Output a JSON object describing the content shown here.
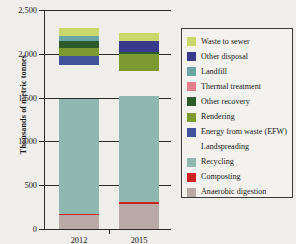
{
  "axes": {
    "y_title": "Thousands of metric tonnes",
    "y_ticks": [
      "2,500",
      "2,000",
      "1,500",
      "1,000",
      "500",
      "0"
    ],
    "x_labels": [
      "2012",
      "2015"
    ]
  },
  "legend": {
    "items": [
      {
        "label": "Waste to sewer",
        "color": "#cad86b"
      },
      {
        "label": "Other disposal",
        "color": "#3a3a8c"
      },
      {
        "label": "Landfill",
        "color": "#6aa6a6"
      },
      {
        "label": "Thermal treatment",
        "color": "#e4808e"
      },
      {
        "label": "Other recovery",
        "color": "#2c5c2c"
      },
      {
        "label": "Rendering",
        "color": "#7d9a30"
      },
      {
        "label": "Energy from waste (EFW)",
        "color": "#41529a"
      },
      {
        "label": "Landspreading",
        "color": "#a濃"
      },
      {
        "label": "Recycling",
        "color": "#8fb8b0"
      },
      {
        "label": "Composting",
        "color": "#cc2222"
      },
      {
        "label": "Anaerobic digestion",
        "color": "#b9aaa8"
      }
    ]
  },
  "chart_data": {
    "type": "bar",
    "title": "",
    "xlabel": "",
    "ylabel": "Thousands of metric tonnes",
    "ylim": [
      0,
      2500
    ],
    "ytick_values": [
      0,
      500,
      1000,
      1500,
      2000,
      2500
    ],
    "grid": false,
    "stacked": true,
    "legend_position": "right",
    "categories": [
      "2012",
      "2015"
    ],
    "series": [
      {
        "name": "Anaerobic digestion",
        "color": "#b9aaa8",
        "values": [
          155,
          285
        ]
      },
      {
        "name": "Composting",
        "color": "#cc2222",
        "values": [
          20,
          18
        ]
      },
      {
        "name": "Recycling",
        "color": "#8fb8b0",
        "values": [
          1305,
          1220
        ]
      },
      {
        "name": "Landspreading",
        "color": "#a濃",
        "values": [
          390,
          285
        ]
      },
      {
        "name": "Energy from waste (EFW)",
        "color": "#41529a",
        "values": [
          105,
          0
        ]
      },
      {
        "name": "Rendering",
        "color": "#7d9a30",
        "values": [
          90,
          185
        ]
      },
      {
        "name": "Other recovery",
        "color": "#2c5c2c",
        "values": [
          85,
          30
        ]
      },
      {
        "name": "Thermal treatment",
        "color": "#e4808e",
        "values": [
          0,
          0
        ]
      },
      {
        "name": "Landfill",
        "color": "#6aa6a6",
        "values": [
          55,
          0
        ]
      },
      {
        "name": "Other disposal",
        "color": "#3a3a8c",
        "values": [
          0,
          120
        ]
      },
      {
        "name": "Waste to sewer",
        "color": "#cad86b",
        "values": [
          95,
          100
        ]
      }
    ],
    "totals": [
      2300,
      2243
    ]
  }
}
